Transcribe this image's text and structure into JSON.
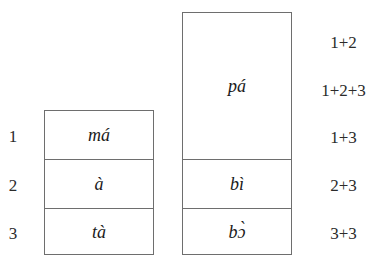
{
  "figure": {
    "row_indices": [
      {
        "label": "1"
      },
      {
        "label": "2"
      },
      {
        "label": "3"
      }
    ],
    "table_left": {
      "cells": [
        {
          "text": "má"
        },
        {
          "text": "à"
        },
        {
          "text": "tà"
        }
      ]
    },
    "table_right": {
      "cells": [
        {
          "text": "pá"
        },
        {
          "text": "bì"
        },
        {
          "text": "bɔ̀"
        }
      ]
    },
    "combination_labels": [
      {
        "text": "1+2"
      },
      {
        "text": "1+2+3"
      },
      {
        "text": "1+3"
      },
      {
        "text": "2+3"
      },
      {
        "text": "3+3"
      }
    ],
    "colors": {
      "background": "#ffffff",
      "border": "#6e6e6e",
      "text": "#1a1a1a",
      "label_text": "#2b2b2b"
    }
  }
}
